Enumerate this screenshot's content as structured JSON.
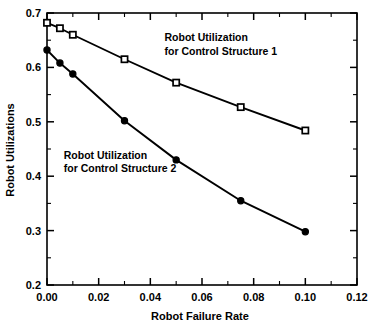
{
  "chart_data": {
    "type": "line",
    "title": "",
    "xlabel": "Robot Failure Rate",
    "ylabel": "Robot  Utilizations",
    "xlim": [
      0.0,
      0.12
    ],
    "ylim": [
      0.2,
      0.7
    ],
    "xticks": [
      0.0,
      0.02,
      0.04,
      0.06,
      0.08,
      0.1,
      0.12
    ],
    "xticklabels": [
      "0.00",
      "0.02",
      "0.04",
      "0.06",
      "0.08",
      "0.10",
      "0.12"
    ],
    "xminorticks": [
      0.01,
      0.03,
      0.05,
      0.07,
      0.09,
      0.11
    ],
    "yticks": [
      0.2,
      0.3,
      0.4,
      0.5,
      0.6,
      0.7
    ],
    "yticklabels": [
      "0.2",
      "0.3",
      "0.4",
      "0.5",
      "0.6",
      "0.7"
    ],
    "yminorticks": [
      0.25,
      0.35,
      0.45,
      0.55,
      0.65
    ],
    "grid": false,
    "legend": "none",
    "x": [
      0.0,
      0.005,
      0.01,
      0.03,
      0.05,
      0.075,
      0.1
    ],
    "series": [
      {
        "name": "Robot Utilization for Control Structure 1",
        "marker": "open-square",
        "values": [
          0.682,
          0.672,
          0.66,
          0.615,
          0.572,
          0.527,
          0.484
        ]
      },
      {
        "name": "Robot Utilization for Control Structure 2",
        "marker": "filled-circle",
        "values": [
          0.632,
          0.608,
          0.588,
          0.502,
          0.43,
          0.355,
          0.298
        ]
      }
    ],
    "annotations": [
      {
        "id": "annotation-structure-1",
        "lines": [
          "Robot  Utilization",
          "for  Control  Structure  1"
        ],
        "x": 0.0455,
        "y": 0.648
      },
      {
        "id": "annotation-structure-2",
        "lines": [
          "Robot  Utilization",
          "for  Control  Structure  2"
        ],
        "x": 0.0065,
        "y": 0.432
      }
    ],
    "colors": {
      "line": "#000000",
      "axis": "#000000",
      "background": "#ffffff",
      "marker_fill_open": "#ffffff",
      "marker_fill_solid": "#000000"
    }
  }
}
